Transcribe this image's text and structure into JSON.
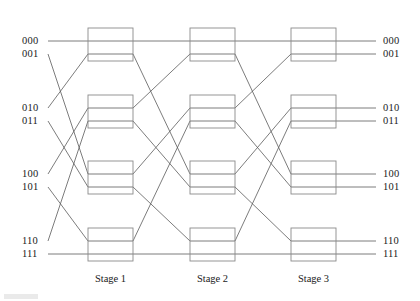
{
  "figure": {
    "type": "network-diagram",
    "width": 420,
    "height": 301,
    "background_color": "#ffffff",
    "wire_color": "#5a5a5a",
    "box_color": "#8a8a8a",
    "text_color": "#1a1a1a"
  },
  "inputs": [
    {
      "label": "000",
      "index": 0,
      "x": 22,
      "y": 36
    },
    {
      "label": "001",
      "index": 1,
      "x": 22,
      "y": 49
    },
    {
      "label": "010",
      "index": 2,
      "x": 22,
      "y": 103
    },
    {
      "label": "011",
      "index": 3,
      "x": 22,
      "y": 116
    },
    {
      "label": "100",
      "index": 4,
      "x": 22,
      "y": 169
    },
    {
      "label": "101",
      "index": 5,
      "x": 22,
      "y": 182
    },
    {
      "label": "110",
      "index": 6,
      "x": 22,
      "y": 236
    },
    {
      "label": "111",
      "index": 7,
      "x": 22,
      "y": 249
    }
  ],
  "outputs": [
    {
      "label": "000",
      "index": 0,
      "x": 383,
      "y": 36
    },
    {
      "label": "001",
      "index": 1,
      "x": 383,
      "y": 49
    },
    {
      "label": "010",
      "index": 2,
      "x": 383,
      "y": 103
    },
    {
      "label": "011",
      "index": 3,
      "x": 383,
      "y": 116
    },
    {
      "label": "100",
      "index": 4,
      "x": 383,
      "y": 169
    },
    {
      "label": "101",
      "index": 5,
      "x": 383,
      "y": 182
    },
    {
      "label": "110",
      "index": 6,
      "x": 383,
      "y": 236
    },
    {
      "label": "111",
      "index": 7,
      "x": 383,
      "y": 249
    }
  ],
  "stages": [
    {
      "id": "stage-1",
      "label": "Stage 1",
      "box_left": 88,
      "box_right": 133,
      "label_x": 110.5,
      "label_y": 274
    },
    {
      "id": "stage-2",
      "label": "Stage 2",
      "box_left": 190,
      "box_right": 235,
      "label_x": 212.5,
      "label_y": 274
    },
    {
      "id": "stage-3",
      "label": "Stage 3",
      "box_left": 291,
      "box_right": 336,
      "label_x": 313.5,
      "label_y": 274
    }
  ],
  "switch_rows": [
    {
      "row": 0,
      "top": 28,
      "bottom": 61,
      "port_top_y": 41,
      "port_bottom_y": 54
    },
    {
      "row": 1,
      "top": 95,
      "bottom": 128,
      "port_top_y": 108,
      "port_bottom_y": 121
    },
    {
      "row": 2,
      "top": 161,
      "bottom": 194,
      "port_top_y": 174,
      "port_bottom_y": 187
    },
    {
      "row": 3,
      "top": 228,
      "bottom": 261,
      "port_top_y": 241,
      "port_bottom_y": 254
    }
  ],
  "port_y_by_index": [
    41,
    54,
    108,
    121,
    174,
    187,
    241,
    254
  ],
  "geometry": {
    "input_line_start_x": 48,
    "output_line_end_x": 376
  },
  "permutations": [
    {
      "name": "input-to-stage-1",
      "description": "perfect shuffle",
      "from_x": 48,
      "to_x": 88,
      "map": [
        0,
        4,
        1,
        5,
        2,
        6,
        3,
        7
      ]
    },
    {
      "name": "stage-1-to-stage-2",
      "description": "perfect shuffle",
      "from_x": 133,
      "to_x": 190,
      "map": [
        0,
        4,
        1,
        5,
        2,
        6,
        3,
        7
      ]
    },
    {
      "name": "stage-2-to-stage-3",
      "description": "perfect shuffle",
      "from_x": 235,
      "to_x": 291,
      "map": [
        0,
        4,
        1,
        5,
        2,
        6,
        3,
        7
      ]
    },
    {
      "name": "stage-3-to-output",
      "description": "straight through",
      "from_x": 336,
      "to_x": 376,
      "map": [
        0,
        1,
        2,
        3,
        4,
        5,
        6,
        7
      ]
    }
  ]
}
